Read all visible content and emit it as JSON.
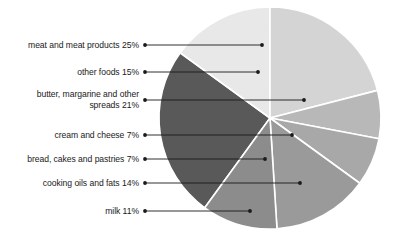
{
  "chart_data": {
    "type": "pie",
    "title": "",
    "subtitle": "",
    "xlabel": "",
    "ylabel": "",
    "legend_position": "none",
    "grid": false,
    "labels_style": "callout-leader-lines",
    "total_percent": 100,
    "categories": [
      "meat and meat products",
      "other foods",
      "butter, margarine and other spreads",
      "cream and cheese",
      "bread, cakes and pastries",
      "cooking oils and fats",
      "milk"
    ],
    "values": [
      25,
      15,
      21,
      7,
      7,
      14,
      11
    ],
    "slices": [
      {
        "name": "meat and meat products",
        "value": 25,
        "label": "meat and meat products 25%",
        "color": "#595959",
        "start_angle": 216,
        "end_angle": 306,
        "leader_y": 45,
        "leader_end_x": 262
      },
      {
        "name": "other foods",
        "value": 15,
        "label": "other foods 15%",
        "color": "#e8e8e8",
        "start_angle": 306,
        "end_angle": 360,
        "leader_y": 72,
        "leader_end_x": 258
      },
      {
        "name": "butter, margarine and other spreads",
        "value": 21,
        "label": "butter, margarine and other\nspreads 21%",
        "color": "#d4d4d4",
        "start_angle": 0,
        "end_angle": 75.6,
        "leader_y": 100,
        "leader_end_x": 304
      },
      {
        "name": "cream and cheese",
        "value": 7,
        "label": "cream and cheese 7%",
        "color": "#b8b8b8",
        "start_angle": 75.6,
        "end_angle": 100.8,
        "leader_y": 135,
        "leader_end_x": 292
      },
      {
        "name": "bread, cakes and pastries",
        "value": 7,
        "label": "bread, cakes and pastries 7%",
        "color": "#a8a8a8",
        "start_angle": 100.8,
        "end_angle": 126,
        "leader_y": 159,
        "leader_end_x": 265
      },
      {
        "name": "cooking oils and fats",
        "value": 14,
        "label": "cooking oils and fats 14%",
        "color": "#9a9a9a",
        "start_angle": 126,
        "end_angle": 176.4,
        "leader_y": 183,
        "leader_end_x": 300
      },
      {
        "name": "milk",
        "value": 11,
        "label": "milk 11%",
        "color": "#8c8c8c",
        "start_angle": 176.4,
        "end_angle": 216,
        "leader_y": 211,
        "leader_end_x": 250
      }
    ],
    "geometry": {
      "center_x": 270,
      "center_y": 118,
      "radius": 111,
      "slice_gap_color": "#ffffff",
      "slice_gap_width": 1.6,
      "leader_dot_x": 145,
      "leader_dot_radius": 1.9,
      "leader_color": "#1a1a1a",
      "label_right_edge": 139
    }
  }
}
